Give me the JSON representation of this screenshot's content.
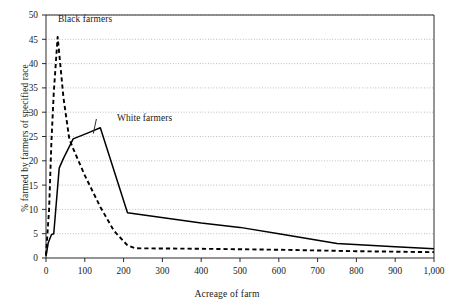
{
  "chart_data": {
    "type": "line",
    "title": "",
    "xlabel": "Acreage of farm",
    "ylabel": "% farmed by farmers of specified race",
    "xlim": [
      0,
      1000
    ],
    "ylim": [
      0,
      50
    ],
    "xticks": [
      0,
      100,
      200,
      300,
      400,
      500,
      600,
      700,
      800,
      900,
      1000
    ],
    "xticklabels": [
      "0",
      "100",
      "200",
      "300",
      "400",
      "500",
      "600",
      "700",
      "800",
      "900",
      "1,000"
    ],
    "yticks": [
      0,
      5,
      10,
      15,
      20,
      25,
      30,
      35,
      40,
      45,
      50
    ],
    "yticklabels": [
      "0",
      "5",
      "10",
      "15",
      "20",
      "25",
      "30",
      "35",
      "40",
      "45",
      "50"
    ],
    "grid": "horizontal-dotted",
    "legend_position": "inline-annotations",
    "series": [
      {
        "name": "Black farmers",
        "style": "dashed",
        "color": "#000000",
        "label_x": 95,
        "label_y": 48,
        "points": [
          {
            "x": 0,
            "y": 0.6
          },
          {
            "x": 8,
            "y": 10.0
          },
          {
            "x": 14,
            "y": 24.0
          },
          {
            "x": 20,
            "y": 34.0
          },
          {
            "x": 30,
            "y": 45.5
          },
          {
            "x": 45,
            "y": 33.0
          },
          {
            "x": 60,
            "y": 24.5
          },
          {
            "x": 70,
            "y": 22.5
          },
          {
            "x": 100,
            "y": 17.0
          },
          {
            "x": 140,
            "y": 10.5
          },
          {
            "x": 175,
            "y": 5.6
          },
          {
            "x": 210,
            "y": 2.6
          },
          {
            "x": 230,
            "y": 2.0
          },
          {
            "x": 400,
            "y": 1.9
          },
          {
            "x": 600,
            "y": 1.7
          },
          {
            "x": 800,
            "y": 1.4
          },
          {
            "x": 1000,
            "y": 1.2
          }
        ]
      },
      {
        "name": "White farmers",
        "style": "solid",
        "color": "#000000",
        "label_x": 215,
        "label_y": 30,
        "points": [
          {
            "x": 0,
            "y": 0.4
          },
          {
            "x": 6,
            "y": 3.2
          },
          {
            "x": 14,
            "y": 4.8
          },
          {
            "x": 20,
            "y": 5.0
          },
          {
            "x": 34,
            "y": 18.5
          },
          {
            "x": 45,
            "y": 20.5
          },
          {
            "x": 70,
            "y": 24.5
          },
          {
            "x": 110,
            "y": 25.8
          },
          {
            "x": 140,
            "y": 26.8
          },
          {
            "x": 210,
            "y": 9.3
          },
          {
            "x": 400,
            "y": 7.2
          },
          {
            "x": 500,
            "y": 6.3
          },
          {
            "x": 600,
            "y": 5.0
          },
          {
            "x": 750,
            "y": 3.0
          },
          {
            "x": 900,
            "y": 2.3
          },
          {
            "x": 1000,
            "y": 1.9
          }
        ]
      }
    ],
    "annotations": [
      {
        "text": "Black farmers",
        "for": "Black farmers"
      },
      {
        "text": "White farmers",
        "for": "White farmers"
      }
    ]
  }
}
